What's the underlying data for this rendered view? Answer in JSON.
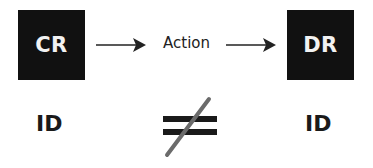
{
  "diagram": {
    "left_box": {
      "label": "CR",
      "color": "#111111"
    },
    "right_box": {
      "label": "DR",
      "color": "#111111"
    },
    "transition": {
      "label": "Action"
    },
    "bottom": {
      "left_label": "ID",
      "right_label": "ID",
      "relation": "not-equal"
    },
    "colors": {
      "text": "#1a1a1a",
      "slash": "#6b6b6b",
      "box_text": "#f2f2f2"
    }
  }
}
